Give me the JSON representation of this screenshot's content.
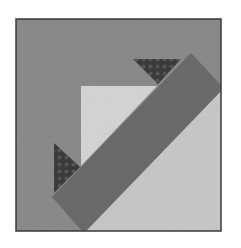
{
  "image": {
    "description": "Grayscale quilt block with diagonal band and triangles",
    "width": 241,
    "height": 248
  },
  "colors": {
    "page_bg": "#ffffff",
    "frame": "#3a3a3a",
    "background_fabric": "#8c8c8c",
    "light_corner_fabric": "#c9c9c9",
    "light_triangle_fabric": "#d6d6d6",
    "band_fabric": "#6c6c6c",
    "dark_triangle_fabric": "#3c3c3c",
    "dot": "#575757"
  },
  "block": {
    "frame": {
      "x": 16,
      "y": 19,
      "w": 205,
      "h": 212
    },
    "light_corner": "86,231 221,91 221,231",
    "light_triangle": "81,86 157,86 81,166",
    "top_dark_triangle": "133,59 181,59 158,84",
    "left_dark_triangle": "54,143 80,167 54,193",
    "band": "191,53 221,85 221,91 86,231 82,231 52,197"
  }
}
